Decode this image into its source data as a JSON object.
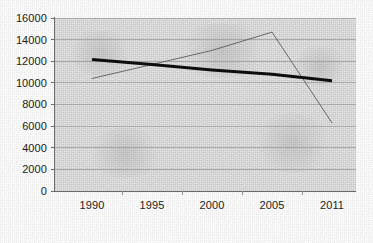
{
  "chart_data": {
    "type": "line",
    "title": "",
    "subtitle": "",
    "xlabel": "",
    "ylabel": "",
    "categories": [
      "1990",
      "1995",
      "2000",
      "2005",
      "2011"
    ],
    "x_tick_labels": [
      "1990",
      "1995",
      "2000",
      "2005",
      "2011"
    ],
    "y_tick_labels": [
      "16000",
      "14000",
      "12000",
      "10000",
      "8000",
      "6000",
      "4000",
      "2000",
      "0"
    ],
    "y_ticks": [
      16000,
      14000,
      12000,
      10000,
      8000,
      6000,
      4000,
      2000,
      0
    ],
    "ylim": [
      0,
      16000
    ],
    "y_step": 2000,
    "grid": "horizontal",
    "legend": "none",
    "series": [
      {
        "name": "data-series",
        "style": "thin-line",
        "color": "#555555",
        "width": 1,
        "values": [
          10400,
          11700,
          13000,
          14700,
          6300
        ]
      },
      {
        "name": "trend-line",
        "style": "thick-line",
        "color": "#0d0d0d",
        "width": 3,
        "values": [
          12150,
          11700,
          11200,
          10800,
          10200
        ]
      }
    ],
    "colors": {
      "plot_background": "#e6e6e6",
      "page_background": "#ffffff",
      "gridline": "#9a9a9a",
      "axis": "#6b6b6b",
      "tick_label": "#1c1c1c",
      "series_thin": "#555555",
      "series_thick": "#0d0d0d"
    },
    "geometry": {
      "plot_left": 55,
      "plot_top": 18,
      "plot_width": 301,
      "plot_height": 173,
      "category_centers_x": [
        92,
        152,
        212,
        272,
        332
      ]
    }
  }
}
